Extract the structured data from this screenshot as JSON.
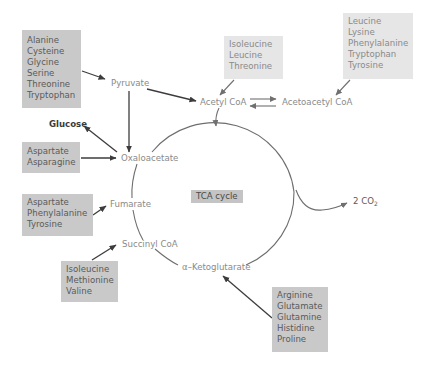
{
  "diagram": {
    "cycle_label": "TCA cycle",
    "intermediates": {
      "pyruvate": "Pyruvate",
      "acetyl_coa": "Acetyl CoA",
      "acetoacetyl_coa": "Acetoacetyl CoA",
      "oxaloacetate": "Oxaloacetate",
      "fumarate": "Fumarate",
      "succinyl_coa": "Succinyl CoA",
      "alpha_ketoglutarate": "α–Ketoglutarate",
      "glucose": "Glucose",
      "co2_prefix": "2 CO",
      "co2_sub": "2"
    },
    "groups": {
      "to_pyruvate": [
        "Alanine",
        "Cysteine",
        "Glycine",
        "Serine",
        "Threonine",
        "Tryptophan"
      ],
      "to_acetyl_coa": [
        "Isoleucine",
        "Leucine",
        "Threonine"
      ],
      "to_acetoacetyl_coa": [
        "Leucine",
        "Lysine",
        "Phenylalanine",
        "Tryptophan",
        "Tyrosine"
      ],
      "to_oxaloacetate": [
        "Aspartate",
        "Asparagine"
      ],
      "to_fumarate": [
        "Aspartate",
        "Phenylalanine",
        "Tyrosine"
      ],
      "to_succinyl_coa": [
        "Isoleucine",
        "Methionine",
        "Valine"
      ],
      "to_alpha_ketoglutarate": [
        "Arginine",
        "Glutamate",
        "Glutamine",
        "Histidine",
        "Proline"
      ]
    },
    "colors": {
      "box_mid": "#c9c9c9",
      "box_light": "#e6e6e6",
      "arrow_dark": "#3c3c3c",
      "arrow_light": "#7a7a7a",
      "cycle_line": "#6e6e6e"
    }
  }
}
